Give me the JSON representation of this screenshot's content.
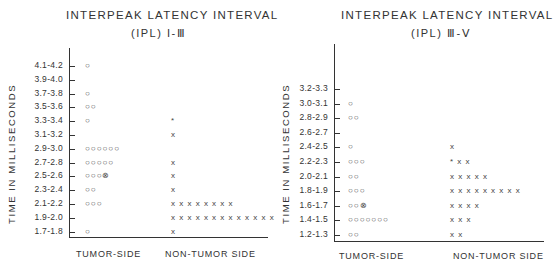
{
  "chart_data": [
    {
      "type": "scatter",
      "title": "INTERPEAK LATENCY INTERVAL",
      "subtitle": "(IPL) I-III",
      "ylabel": "TIME IN MILLISECONDS",
      "xlabel": "",
      "categories": [
        "TUMOR-SIDE",
        "NON-TUMOR SIDE"
      ],
      "y_ticks": [
        "4.1-4.2",
        "3.9-4.0",
        "3.7-3.8",
        "3.5-3.6",
        "3.3-3.4",
        "3.1-3.2",
        "2.9-3.0",
        "2.7-2.8",
        "2.5-2.6",
        "2.3-2.4",
        "2.1-2.2",
        "1.9-2.0",
        "1.7-1.8"
      ],
      "series": [
        {
          "name": "TUMOR-SIDE",
          "marker": "o",
          "counts": [
            1,
            0,
            1,
            2,
            1,
            0,
            6,
            5,
            4,
            2,
            3,
            0,
            1
          ],
          "marks": [
            "o",
            "",
            "o",
            "oo",
            "o",
            "",
            "oooooo",
            "ooooo",
            "ooo⊗",
            "oo",
            "ooo",
            "",
            "o"
          ]
        },
        {
          "name": "NON-TUMOR SIDE",
          "marker": "x",
          "counts": [
            0,
            0,
            0,
            0,
            1,
            1,
            0,
            1,
            1,
            1,
            8,
            13,
            1
          ],
          "marks": [
            "",
            "",
            "",
            "",
            "*",
            "x",
            "",
            "x",
            "x",
            "x",
            "xxxxxxxx",
            "xxxxxxxxxxxxx",
            "x"
          ]
        }
      ]
    },
    {
      "type": "scatter",
      "title": "INTERPEAK LATENCY INTERVAL",
      "subtitle": "(IPL) III-V",
      "ylabel": "TIME IN MILLISECONDS",
      "xlabel": "",
      "categories": [
        "TUMOR-SIDE",
        "NON-TUMOR SIDE"
      ],
      "y_ticks": [
        "3.2-3.3",
        "3.0-3.1",
        "2.8-2.9",
        "2.6-2.7",
        "2.4-2.5",
        "2.2-2.3",
        "2.0-2.1",
        "1.8-1.9",
        "1.6-1.7",
        "1.4-1.5",
        "1.2-1.3"
      ],
      "series": [
        {
          "name": "TUMOR-SIDE",
          "marker": "o",
          "counts": [
            0,
            1,
            2,
            0,
            1,
            3,
            2,
            3,
            3,
            7,
            2
          ],
          "marks": [
            "",
            "o",
            "oo",
            "",
            "o",
            "ooo",
            "oo",
            "ooo",
            "oo⊗",
            "ooooooo",
            "oo"
          ]
        },
        {
          "name": "NON-TUMOR SIDE",
          "marker": "x",
          "counts": [
            0,
            0,
            0,
            0,
            1,
            3,
            5,
            9,
            4,
            3,
            2
          ],
          "marks": [
            "",
            "",
            "",
            "",
            "x",
            "*xx",
            "xxxxx",
            "xxxxxxxxx",
            "xxxx",
            "xxx",
            "xx"
          ]
        }
      ]
    }
  ],
  "left": {
    "title": "INTERPEAK LATENCY INTERVAL",
    "subtitle": "(IPL) I-Ⅲ",
    "ylabel": "TIME IN MILLISECONDS",
    "cat1": "TUMOR-SIDE",
    "cat2": "NON-TUMOR SIDE",
    "ticks": [
      "4.1-4.2",
      "3.9-4.0",
      "3.7-3.8",
      "3.5-3.6",
      "3.3-3.4",
      "3.1-3.2",
      "2.9-3.0",
      "2.7-2.8",
      "2.5-2.6",
      "2.3-2.4",
      "2.1-2.2",
      "1.9-2.0",
      "1.7-1.8"
    ],
    "tumor": [
      "○",
      "",
      "○",
      "○○",
      "○",
      "",
      "○○○○○○",
      "○○○○○",
      "○○○⊗",
      "○○",
      "○○○",
      "",
      "○"
    ],
    "non": [
      "",
      "",
      "",
      "",
      "*",
      "x",
      "",
      "x",
      "x",
      "x",
      "x x x x x x x x",
      "x x x x x x x x x x x x x",
      "x"
    ]
  },
  "right": {
    "title": "INTERPEAK LATENCY INTERVAL",
    "subtitle": "(IPL) Ⅲ-Ⅴ",
    "ylabel": "TIME IN MILLISECONDS",
    "cat1": "TUMOR-SIDE",
    "cat2": "NON-TUMOR SIDE",
    "ticks": [
      "3.2-3.3",
      "3.0-3.1",
      "2.8-2.9",
      "2.6-2.7",
      "2.4-2.5",
      "2.2-2.3",
      "2.0-2.1",
      "1.8-1.9",
      "1.6-1.7",
      "1.4-1.5",
      "1.2-1.3"
    ],
    "tumor": [
      "",
      "○",
      "○○",
      "",
      "○",
      "○○○",
      "○○",
      "○○○",
      "○○⊗",
      "○○○○○○○",
      "○○"
    ],
    "non": [
      "",
      "",
      "",
      "",
      "x",
      "* x x",
      "x x x x x",
      "x x x x x x x x x",
      "x x x x",
      "x x x",
      "x x"
    ]
  }
}
